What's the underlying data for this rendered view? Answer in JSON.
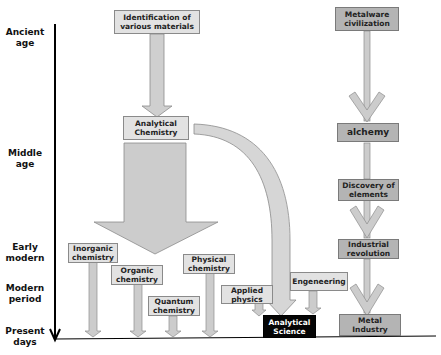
{
  "timeline": {
    "eras": [
      {
        "label": "Ancient\nage"
      },
      {
        "label": "Middle\nage"
      },
      {
        "label": "Early\nmodern"
      },
      {
        "label": "Modern\nperiod"
      },
      {
        "label": "Present\ndays"
      }
    ]
  },
  "nodes": {
    "identification": "Identification of various materials",
    "analytical_chemistry": "Analytical Chemistry",
    "inorganic": "Inorganic chemistry",
    "organic": "Organic chemistry",
    "quantum": "Quantum chemistry",
    "physical": "Physical chemistry",
    "applied_physics": "Applied physics",
    "engineering": "Engeneering",
    "analytical_science": "Analytical Science",
    "metalware": "Metalware civilization",
    "alchemy": "alchemy",
    "discovery": "Discovery of elements",
    "industrial": "Industrial revolution",
    "metal_industry": "Metal Industry"
  },
  "colors": {
    "box_fill": "#dcdcdc",
    "box_dark_fill": "#b4b4b4",
    "arrow_fill": "#d2d2d2",
    "arrow_stroke": "#8c8c8c",
    "highlight_fill": "#050505",
    "axis": "#000000"
  }
}
